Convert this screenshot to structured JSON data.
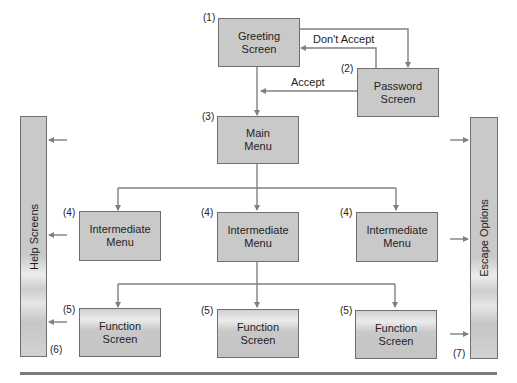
{
  "diagram": {
    "nodes": {
      "greeting": {
        "number": "(1)",
        "label_line1": "Greeting",
        "label_line2": "Screen"
      },
      "password": {
        "number": "(2)",
        "label_line1": "Password",
        "label_line2": "Screen"
      },
      "main_menu": {
        "number": "(3)",
        "label_line1": "Main",
        "label_line2": "Menu"
      },
      "intermediate": [
        {
          "number": "(4)",
          "label_line1": "Intermediate",
          "label_line2": "Menu"
        },
        {
          "number": "(4)",
          "label_line1": "Intermediate",
          "label_line2": "Menu"
        },
        {
          "number": "(4)",
          "label_line1": "Intermediate",
          "label_line2": "Menu"
        }
      ],
      "function": [
        {
          "number": "(5)",
          "label_line1": "Function",
          "label_line2": "Screen"
        },
        {
          "number": "(5)",
          "label_line1": "Function",
          "label_line2": "Screen"
        },
        {
          "number": "(5)",
          "label_line1": "Function",
          "label_line2": "Screen"
        }
      ],
      "help": {
        "number": "(6)",
        "label": "Help Screens"
      },
      "escape": {
        "number": "(7)",
        "label": "Escape Options"
      }
    },
    "edges": {
      "dont_accept": "Don't Accept",
      "accept": "Accept"
    },
    "colors": {
      "box_fill": "#c9c9c9",
      "box_border": "#6f6f6f",
      "line": "#808080",
      "rule": "#7a7a7a"
    }
  }
}
